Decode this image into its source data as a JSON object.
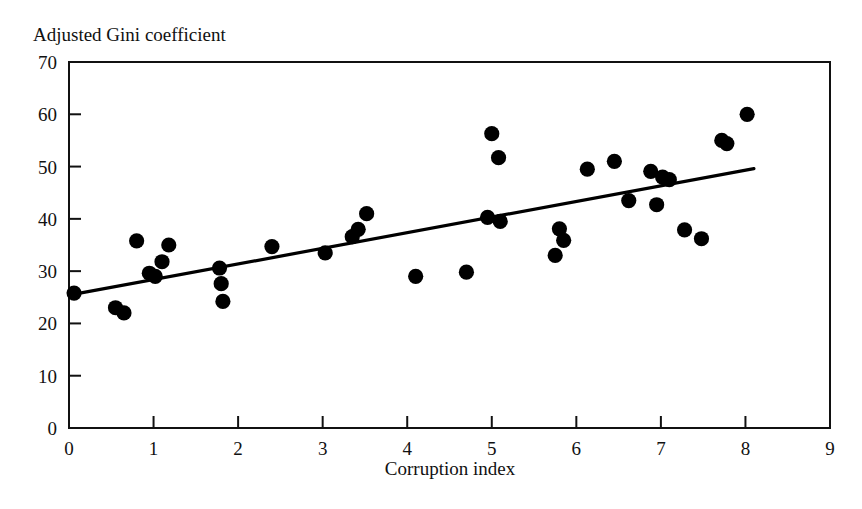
{
  "chart_data": {
    "type": "scatter",
    "title": "Adjusted Gini coefficient",
    "xlabel": "Corruption index",
    "ylabel": "Adjusted Gini coefficient",
    "xlim": [
      0,
      9
    ],
    "ylim": [
      0,
      70
    ],
    "xticks": [
      "0",
      "1",
      "2",
      "3",
      "4",
      "5",
      "6",
      "7",
      "8",
      "9"
    ],
    "yticks": [
      "0",
      "10",
      "20",
      "30",
      "40",
      "50",
      "60",
      "70"
    ],
    "xtick_values": [
      0,
      1,
      2,
      3,
      4,
      5,
      6,
      7,
      8,
      9
    ],
    "ytick_values": [
      0,
      10,
      20,
      30,
      40,
      50,
      60,
      70
    ],
    "grid": false,
    "legend": null,
    "marker": "filled-circle",
    "marker_color": "#000000",
    "frame_color": "#111111",
    "background": "#ffffff",
    "points": [
      {
        "x": 0.06,
        "y": 25.8
      },
      {
        "x": 0.55,
        "y": 23.0
      },
      {
        "x": 0.65,
        "y": 22.0
      },
      {
        "x": 0.8,
        "y": 35.8
      },
      {
        "x": 0.95,
        "y": 29.6
      },
      {
        "x": 1.02,
        "y": 29.0
      },
      {
        "x": 1.1,
        "y": 31.8
      },
      {
        "x": 1.18,
        "y": 35.0
      },
      {
        "x": 1.78,
        "y": 30.6
      },
      {
        "x": 1.8,
        "y": 27.6
      },
      {
        "x": 1.82,
        "y": 24.2
      },
      {
        "x": 2.4,
        "y": 34.7
      },
      {
        "x": 3.03,
        "y": 33.5
      },
      {
        "x": 3.35,
        "y": 36.6
      },
      {
        "x": 3.42,
        "y": 38.0
      },
      {
        "x": 3.52,
        "y": 41.0
      },
      {
        "x": 4.1,
        "y": 29.0
      },
      {
        "x": 4.7,
        "y": 29.8
      },
      {
        "x": 4.95,
        "y": 40.3
      },
      {
        "x": 5.0,
        "y": 56.3
      },
      {
        "x": 5.08,
        "y": 51.7
      },
      {
        "x": 5.1,
        "y": 39.5
      },
      {
        "x": 5.75,
        "y": 33.0
      },
      {
        "x": 5.8,
        "y": 38.1
      },
      {
        "x": 5.85,
        "y": 35.9
      },
      {
        "x": 6.13,
        "y": 49.5
      },
      {
        "x": 6.45,
        "y": 51.0
      },
      {
        "x": 6.62,
        "y": 43.5
      },
      {
        "x": 6.88,
        "y": 49.1
      },
      {
        "x": 6.95,
        "y": 42.7
      },
      {
        "x": 7.02,
        "y": 48.0
      },
      {
        "x": 7.1,
        "y": 47.5
      },
      {
        "x": 7.28,
        "y": 37.9
      },
      {
        "x": 7.48,
        "y": 36.2
      },
      {
        "x": 7.72,
        "y": 55.0
      },
      {
        "x": 7.78,
        "y": 54.4
      },
      {
        "x": 8.02,
        "y": 60.0
      }
    ],
    "trendline": {
      "type": "linear-fit",
      "x_start": 0.0,
      "y_start": 25.4,
      "x_end": 8.1,
      "y_end": 49.6
    }
  }
}
